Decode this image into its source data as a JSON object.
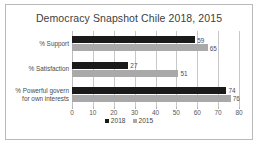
{
  "chart_data": {
    "type": "bar",
    "orientation": "horizontal",
    "title": "Democracy Snapshot Chile 2018, 2015",
    "categories": [
      "% Support",
      "% Satisfaction",
      "% Powerful govern for own interests"
    ],
    "category_lines": [
      [
        "% Support"
      ],
      [
        "% Satisfaction"
      ],
      [
        "% Powerful govern",
        "for own interests"
      ]
    ],
    "series": [
      {
        "name": "2018",
        "color": "#1a1a1a",
        "values": [
          59,
          27,
          74
        ]
      },
      {
        "name": "2015",
        "color": "#a9a9a9",
        "values": [
          65,
          51,
          76
        ]
      }
    ],
    "xlabel": "",
    "ylabel": "",
    "xlim": [
      0,
      80
    ],
    "xticks": [
      0,
      10,
      20,
      30,
      40,
      50,
      60,
      70,
      80
    ],
    "grid": true,
    "legend_position": "bottom",
    "data_labels": true
  },
  "legend": {
    "items": [
      {
        "label": "2018",
        "color": "#1a1a1a"
      },
      {
        "label": "2015",
        "color": "#a9a9a9"
      }
    ]
  }
}
